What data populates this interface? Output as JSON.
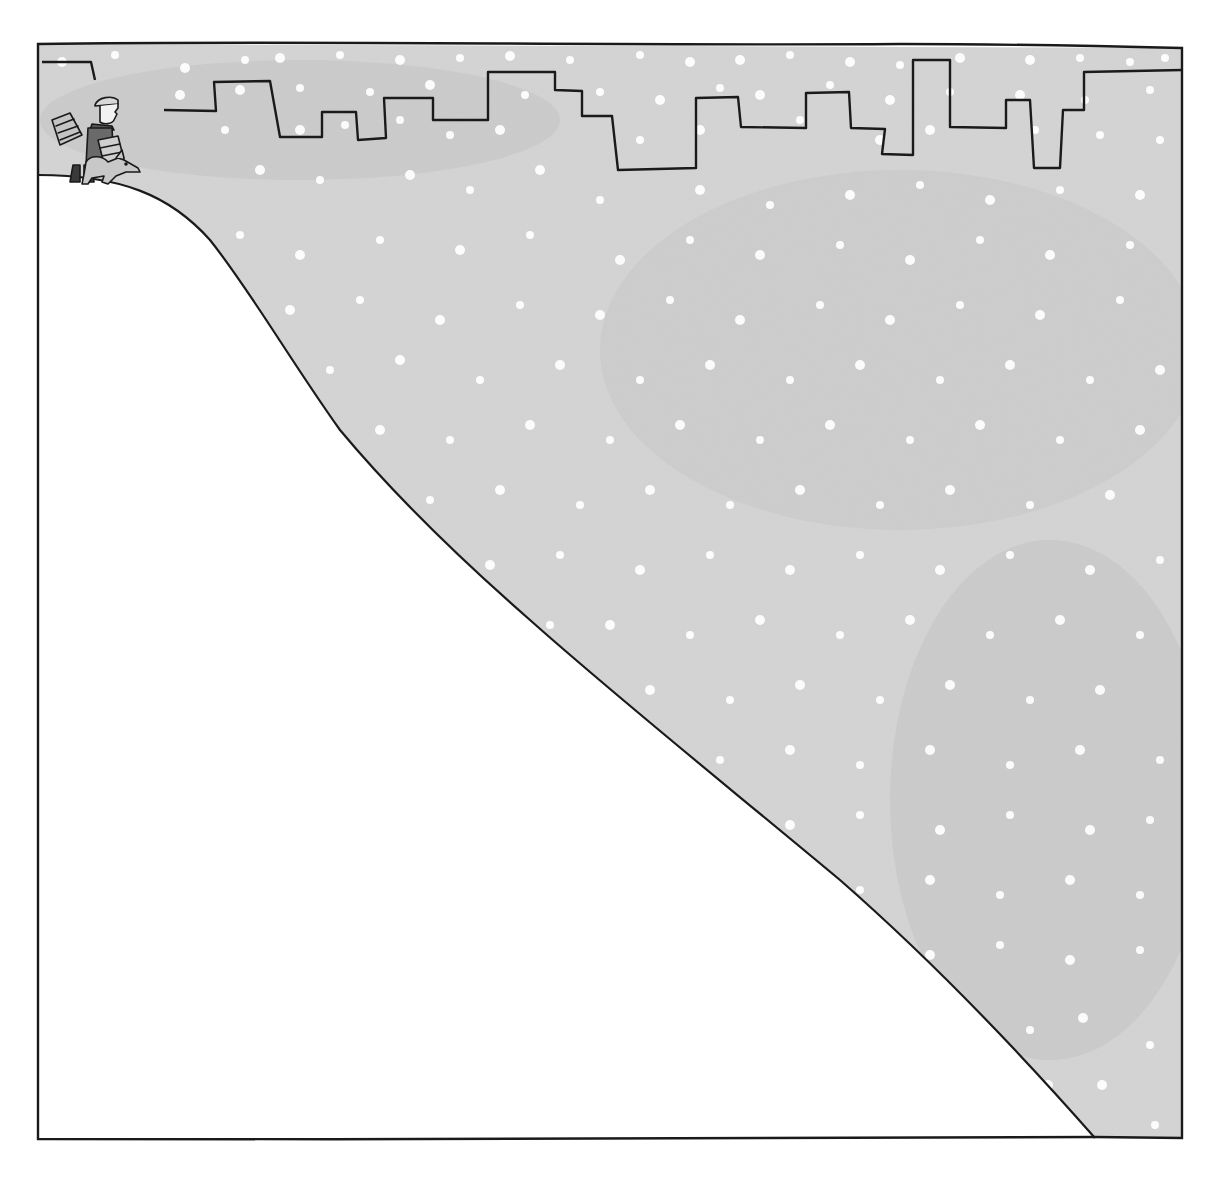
{
  "illustration": {
    "description": "Pen-and-ink cartoon: a small figure carrying packages with a dog stands at the top of a steep snowy hill; a city skyline silhouette runs along the top against a grey sky with falling snow.",
    "colors": {
      "sky": "#cfcfcf",
      "sky_light": "#dcdcdc",
      "snowflake": "#ffffff",
      "ground": "#ffffff",
      "ink": "#1a1a1a",
      "paper": "#ffffff"
    },
    "frame": {
      "x": 38,
      "y": 42,
      "width": 1144,
      "height": 1097
    },
    "elements": [
      {
        "name": "city-skyline",
        "type": "outline"
      },
      {
        "name": "hill-slope",
        "type": "curve"
      },
      {
        "name": "person-with-packages",
        "type": "figure"
      },
      {
        "name": "dog",
        "type": "figure"
      },
      {
        "name": "snowflakes",
        "type": "pattern"
      }
    ]
  }
}
